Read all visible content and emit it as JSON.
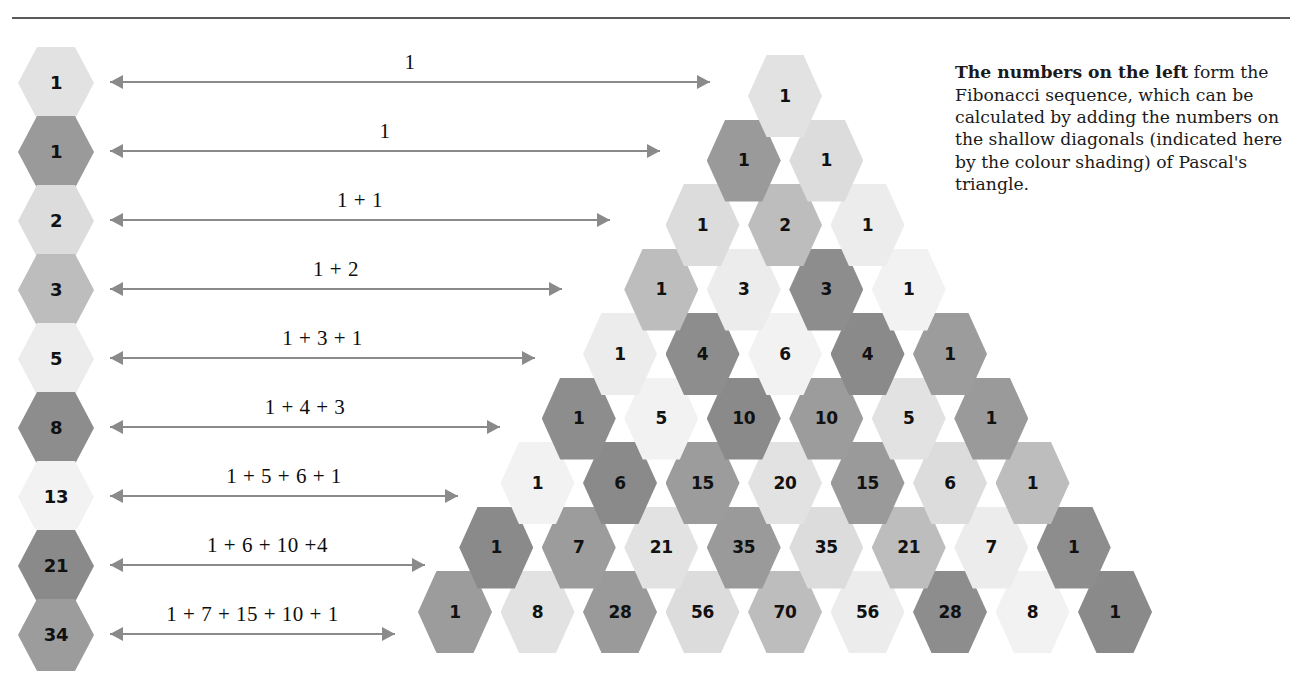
{
  "note": {
    "lead": "The numbers on the left",
    "body": " form the Fibonacci sequence, which can be calculated by adding the numbers on the shallow diagonals (indicated here by the colour shading) of Pascal's triangle."
  },
  "palette": {
    "d0": "#e2e2e2",
    "d1": "#9a9a9a",
    "d2": "#dcdcdc",
    "d3": "#bdbdbd",
    "d4": "#ececec",
    "d5": "#8d8d8d",
    "d6": "#f2f2f2",
    "d7": "#8a8a8a",
    "d8": "#9c9c9c",
    "arrow": "#8a8a8a",
    "rule": "#5a5a5a",
    "text": "#111111"
  },
  "fibonacci": {
    "label": "Fibonacci sequence hexagons",
    "items": [
      {
        "value": "1",
        "diagonal": 0,
        "sum": "1"
      },
      {
        "value": "1",
        "diagonal": 1,
        "sum": "1"
      },
      {
        "value": "2",
        "diagonal": 2,
        "sum": "1 + 1"
      },
      {
        "value": "3",
        "diagonal": 3,
        "sum": "1 + 2"
      },
      {
        "value": "5",
        "diagonal": 4,
        "sum": "1 + 3 + 1"
      },
      {
        "value": "8",
        "diagonal": 5,
        "sum": "1 + 4 + 3"
      },
      {
        "value": "13",
        "diagonal": 6,
        "sum": "1 + 5 + 6 + 1"
      },
      {
        "value": "21",
        "diagonal": 7,
        "sum": "1 + 6 + 10 +4"
      },
      {
        "value": "34",
        "diagonal": 8,
        "sum": "1 + 7 + 15 + 10 + 1"
      }
    ]
  },
  "chart_data": {
    "type": "table",
    "rows": [
      [
        "1"
      ],
      [
        "1",
        "1"
      ],
      [
        "1",
        "2",
        "1"
      ],
      [
        "1",
        "3",
        "3",
        "1"
      ],
      [
        "1",
        "4",
        "6",
        "4",
        "1"
      ],
      [
        "1",
        "5",
        "10",
        "10",
        "5",
        "1"
      ],
      [
        "1",
        "6",
        "15",
        "20",
        "15",
        "6",
        "1"
      ],
      [
        "1",
        "7",
        "21",
        "35",
        "35",
        "21",
        "7",
        "1"
      ],
      [
        "1",
        "8",
        "28",
        "56",
        "70",
        "56",
        "28",
        "8",
        "1"
      ]
    ],
    "diagonal_rule": "shade index = row + column",
    "diagonal_sums": [
      "1",
      "1",
      "1 + 1",
      "1 + 2",
      "1 + 3 + 1",
      "1 + 4 + 3",
      "1 + 5 + 6 + 1",
      "1 + 6 + 10 +4",
      "1 + 7 + 15 + 10 + 1"
    ],
    "fibonacci_values": [
      "1",
      "1",
      "2",
      "3",
      "5",
      "8",
      "13",
      "21",
      "34"
    ]
  },
  "layout": {
    "fib_x": 18,
    "fib_y0": 47,
    "fib_dy": 69,
    "tri_cx": 785,
    "tri_y0": 55,
    "tri_dx": 82.5,
    "tri_dy": 64.5,
    "arrow_x": 110,
    "arrow_y0": 69,
    "arrow_dy": 69,
    "arrow_widths": [
      600,
      550,
      500,
      452,
      425,
      390,
      348,
      315,
      285
    ]
  }
}
